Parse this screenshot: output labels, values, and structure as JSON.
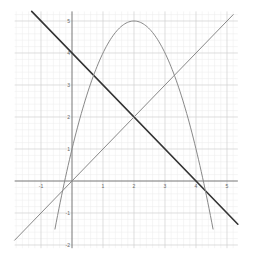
{
  "chart_data": {
    "type": "line",
    "title": "",
    "xlabel": "",
    "ylabel": "",
    "xlim": [
      -1.85,
      5.35
    ],
    "ylim": [
      -2.1,
      5.3
    ],
    "grid": true,
    "minor_grid": true,
    "x_ticks": [
      -1,
      1,
      2,
      3,
      4,
      5
    ],
    "y_ticks": [
      -2,
      -1,
      1,
      2,
      3,
      4,
      5
    ],
    "x_tick_labels": [
      "-1",
      "1",
      "2",
      "3",
      "4",
      "5"
    ],
    "y_tick_labels": [
      "-2",
      "-1",
      "1",
      "2",
      "3",
      "4",
      "5"
    ],
    "series": [
      {
        "name": "y = -x + 4",
        "kind": "line",
        "color": "#333333",
        "width": 1.6,
        "x": [
          -1.3,
          5.35
        ],
        "y": [
          5.3,
          -1.35
        ]
      },
      {
        "name": "y = x",
        "kind": "line",
        "color": "#888888",
        "width": 1.0,
        "x": [
          -1.85,
          5.2
        ],
        "y": [
          -1.85,
          5.2
        ]
      },
      {
        "name": "y = -x^2 + 4x + 1",
        "kind": "parabola",
        "color": "#888888",
        "width": 1.0,
        "vertex": [
          2,
          5
        ],
        "x_intercepts": [
          -0.236,
          4.236
        ],
        "y_intercept": 1,
        "x": [
          -0.55,
          -0.236,
          0,
          0.5,
          1,
          1.5,
          2,
          2.5,
          3,
          3.5,
          4,
          4.236,
          4.55
        ],
        "y": [
          -2.1,
          0,
          1,
          2.75,
          4,
          4.75,
          5,
          4.75,
          4,
          2.75,
          1,
          0,
          -2.1
        ]
      }
    ],
    "intersections": [
      [
        2,
        2
      ],
      [
        4,
        0
      ],
      [
        0,
        4
      ],
      [
        0,
        0
      ]
    ]
  }
}
